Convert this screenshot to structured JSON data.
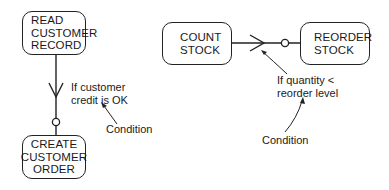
{
  "diagram": {
    "left_example": {
      "process_top": {
        "lines": [
          "READ",
          "CUSTOMER",
          "RECORD"
        ]
      },
      "process_bottom": {
        "lines": [
          "CREATE",
          "CUSTOMER",
          "ORDER"
        ]
      },
      "condition_text": {
        "lines": [
          "If customer",
          "credit is OK"
        ]
      },
      "annotation": "Condition"
    },
    "right_example": {
      "process_left": {
        "lines": [
          "COUNT",
          "STOCK"
        ]
      },
      "process_right": {
        "lines": [
          "REORDER",
          "STOCK"
        ]
      },
      "condition_text": {
        "lines": [
          "If quantity <",
          "reorder level"
        ]
      },
      "annotation": "Condition"
    },
    "connector_symbols": [
      "crows-foot",
      "optional-circle"
    ]
  }
}
